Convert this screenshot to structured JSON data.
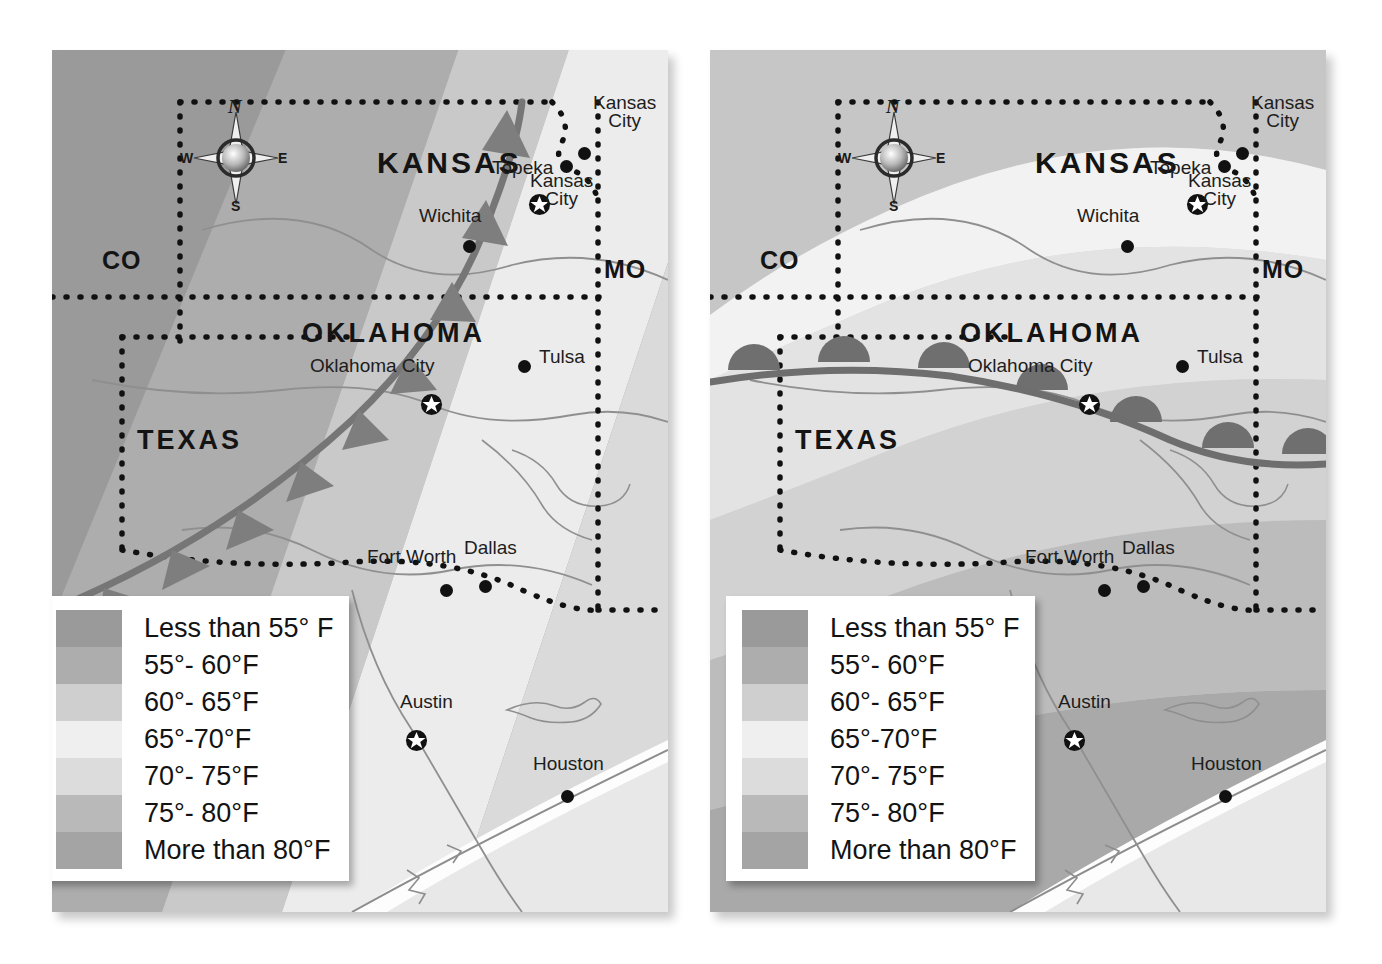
{
  "figure": {
    "kind": "two-panel weather map",
    "background_color": "#ffffff"
  },
  "legend": {
    "items": [
      {
        "label": "Less than 55° F",
        "color": "#9a9a9a"
      },
      {
        "label": "55°- 60°F",
        "color": "#adadad"
      },
      {
        "label": "60°- 65°F",
        "color": "#cfcfcf"
      },
      {
        "label": "65°-70°F",
        "color": "#efefef"
      },
      {
        "label": "70°- 75°F",
        "color": "#dcdcdc"
      },
      {
        "label": "75°- 80°F",
        "color": "#b9b9b9"
      },
      {
        "label": "More than 80°F",
        "color": "#a4a4a4"
      }
    ]
  },
  "compass": {
    "north": "N",
    "south": "S",
    "east": "E",
    "west": "W"
  },
  "maps": [
    {
      "id": "map-left",
      "front_type": "cold-front",
      "front_symbol": "triangles",
      "states_major": [
        {
          "name": "KANSAS",
          "x": 325,
          "y": 96,
          "size": 30
        },
        {
          "name": "OKLAHOMA",
          "x": 250,
          "y": 268,
          "size": 27
        },
        {
          "name": "TEXAS",
          "x": 85,
          "y": 375,
          "size": 27
        }
      ],
      "states_abbr": [
        {
          "name": "CO",
          "x": 50,
          "y": 196
        },
        {
          "name": "MO",
          "x": 552,
          "y": 205
        }
      ],
      "cities": [
        {
          "name": "Wichita",
          "lx": 367,
          "ly": 155,
          "dx": 411,
          "dy": 190,
          "capital": false,
          "align": "center"
        },
        {
          "name": "Topeka",
          "lx": 440,
          "ly": 107,
          "dx": 476,
          "dy": 143,
          "capital": true,
          "align": "center"
        },
        {
          "name": "Kansas\nCity",
          "lx": 541,
          "ly": 44,
          "dx": 526,
          "dy": 97,
          "capital": false,
          "align": "center"
        },
        {
          "name": "Kansas\nCity",
          "lx": 478,
          "ly": 122,
          "dx": 508,
          "dy": 110,
          "capital": false,
          "align": "center"
        },
        {
          "name": "Tulsa",
          "lx": 487,
          "ly": 296,
          "dx": 466,
          "dy": 310,
          "capital": false,
          "align": "left"
        },
        {
          "name": "Oklahoma City",
          "lx": 258,
          "ly": 305,
          "dx": 368,
          "dy": 343,
          "capital": true,
          "align": "center"
        },
        {
          "name": "Fort Worth",
          "lx": 315,
          "ly": 496,
          "dx": 388,
          "dy": 534,
          "capital": false,
          "align": "center"
        },
        {
          "name": "Dallas",
          "lx": 412,
          "ly": 487,
          "dx": 427,
          "dy": 530,
          "capital": false,
          "align": "center"
        },
        {
          "name": "Austin",
          "lx": 348,
          "ly": 641,
          "dx": 353,
          "dy": 679,
          "capital": true,
          "align": "center"
        },
        {
          "name": "Houston",
          "lx": 481,
          "ly": 703,
          "dx": 509,
          "dy": 740,
          "capital": false,
          "align": "center"
        }
      ]
    },
    {
      "id": "map-right",
      "front_type": "warm-front",
      "front_symbol": "semicircles",
      "states_major": [
        {
          "name": "KANSAS",
          "x": 325,
          "y": 96,
          "size": 30
        },
        {
          "name": "OKLAHOMA",
          "x": 250,
          "y": 268,
          "size": 27
        },
        {
          "name": "TEXAS",
          "x": 85,
          "y": 375,
          "size": 27
        }
      ],
      "states_abbr": [
        {
          "name": "CO",
          "x": 50,
          "y": 196
        },
        {
          "name": "MO",
          "x": 552,
          "y": 205
        }
      ],
      "cities": [
        {
          "name": "Wichita",
          "lx": 367,
          "ly": 155,
          "dx": 411,
          "dy": 190,
          "capital": false,
          "align": "center"
        },
        {
          "name": "Topeka",
          "lx": 440,
          "ly": 107,
          "dx": 476,
          "dy": 143,
          "capital": true,
          "align": "center"
        },
        {
          "name": "Kansas\nCity",
          "lx": 541,
          "ly": 44,
          "dx": 526,
          "dy": 97,
          "capital": false,
          "align": "center"
        },
        {
          "name": "Kansas\nCity",
          "lx": 478,
          "ly": 122,
          "dx": 508,
          "dy": 110,
          "capital": false,
          "align": "center"
        },
        {
          "name": "Tulsa",
          "lx": 487,
          "ly": 296,
          "dx": 466,
          "dy": 310,
          "capital": false,
          "align": "left"
        },
        {
          "name": "Oklahoma City",
          "lx": 258,
          "ly": 305,
          "dx": 368,
          "dy": 343,
          "capital": true,
          "align": "center"
        },
        {
          "name": "Fort Worth",
          "lx": 315,
          "ly": 496,
          "dx": 388,
          "dy": 534,
          "capital": false,
          "align": "center"
        },
        {
          "name": "Dallas",
          "lx": 412,
          "ly": 487,
          "dx": 427,
          "dy": 530,
          "capital": false,
          "align": "center"
        },
        {
          "name": "Austin",
          "lx": 348,
          "ly": 641,
          "dx": 353,
          "dy": 679,
          "capital": true,
          "align": "center"
        },
        {
          "name": "Houston",
          "lx": 481,
          "ly": 703,
          "dx": 509,
          "dy": 740,
          "capital": false,
          "align": "center"
        }
      ]
    }
  ],
  "chart_data": {
    "type": "map",
    "title": "",
    "panels": [
      {
        "name": "Cold front map",
        "front": "cold",
        "front_marker": "filled triangles pointing toward warm air (southwest)",
        "temperature_bands_northwest_to_southeast": [
          "Less than 55° F",
          "55°- 60°F",
          "60°- 65°F",
          "65°-70°F",
          "70°- 75°F",
          "75°- 80°F",
          "More than 80°F"
        ]
      },
      {
        "name": "Warm front map",
        "front": "warm",
        "front_marker": "filled semicircles pointing toward cold air (north)",
        "temperature_bands_northwest_to_southeast": [
          "Less than 55° F",
          "55°- 60°F",
          "60°- 65°F",
          "65°-70°F",
          "70°- 75°F",
          "75°- 80°F",
          "More than 80°F"
        ]
      }
    ],
    "legend_labels": [
      "Less than 55° F",
      "55°- 60°F",
      "60°- 65°F",
      "65°-70°F",
      "70°- 75°F",
      "75°- 80°F",
      "More than 80°F"
    ],
    "legend_colors": [
      "#9a9a9a",
      "#adadad",
      "#cfcfcf",
      "#efefef",
      "#dcdcdc",
      "#b9b9b9",
      "#a4a4a4"
    ],
    "states_shown": [
      "KANSAS",
      "OKLAHOMA",
      "TEXAS",
      "CO",
      "MO"
    ],
    "cities_shown": [
      "Wichita",
      "Topeka",
      "Kansas City",
      "Kansas City",
      "Tulsa",
      "Oklahoma City",
      "Fort Worth",
      "Dallas",
      "Austin",
      "Houston"
    ],
    "capitals": [
      "Topeka",
      "Oklahoma City",
      "Austin"
    ]
  }
}
